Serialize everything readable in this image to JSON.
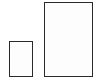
{
  "icon": {
    "name": "page-size-icon",
    "pages": [
      {
        "name": "small-page",
        "fill": "#fdfdfd",
        "stroke": "#2b2b2b"
      },
      {
        "name": "large-page",
        "fill": "#fdfdfd",
        "stroke": "#2b2b2b"
      }
    ]
  }
}
